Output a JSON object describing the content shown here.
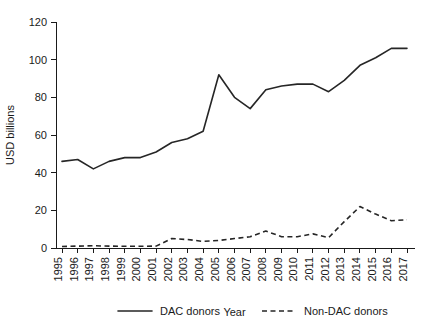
{
  "chart_data": {
    "type": "line",
    "title": "",
    "xlabel": "Year",
    "ylabel": "USD billions",
    "xlim": [
      1995,
      2017
    ],
    "ylim": [
      0,
      120
    ],
    "yticks": [
      0,
      20,
      40,
      60,
      80,
      100,
      120
    ],
    "grid": false,
    "legend_position": "bottom",
    "categories": [
      "1995",
      "1996",
      "1997",
      "1998",
      "1999",
      "2000",
      "2001",
      "2002",
      "2003",
      "2004",
      "2005",
      "2006",
      "2007",
      "2008",
      "2009",
      "2010",
      "2011",
      "2012",
      "2013",
      "2014",
      "2015",
      "2016",
      "2017"
    ],
    "series": [
      {
        "name": "DAC donors",
        "style": "solid",
        "values": [
          46,
          47,
          42,
          46,
          48,
          48,
          51,
          56,
          58,
          62,
          92,
          80,
          74,
          84,
          86,
          87,
          87,
          83,
          89,
          97,
          101,
          106,
          106
        ]
      },
      {
        "name": "Non-DAC donors",
        "style": "dashed",
        "values": [
          0.8,
          1.0,
          1.2,
          1.0,
          0.9,
          0.9,
          1.0,
          5.0,
          4.5,
          3.5,
          4.0,
          5.0,
          6.0,
          9.0,
          6.0,
          6.0,
          7.5,
          5.5,
          14.0,
          22.0,
          18.0,
          14.5,
          15.0
        ]
      }
    ]
  },
  "legend": {
    "items": [
      {
        "label": "DAC donors",
        "style": "solid"
      },
      {
        "label": "Non-DAC donors",
        "style": "dashed"
      }
    ]
  }
}
